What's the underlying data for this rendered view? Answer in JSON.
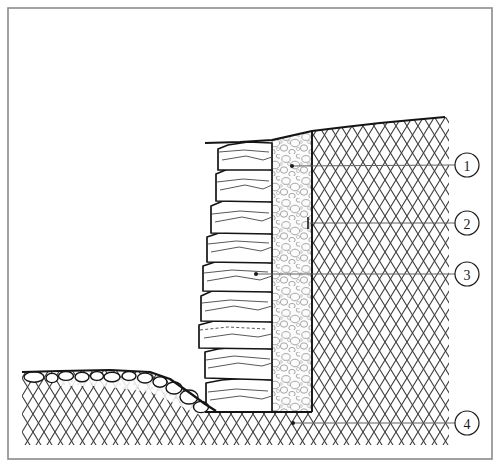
{
  "figure": {
    "border_color": "#8a8a8a",
    "background": "#ffffff",
    "line_color": "#1a1a1a",
    "hatch_color": "#3a3a3a",
    "gravel_color": "#9a9a9a",
    "leader_color": "#555555"
  },
  "callouts": [
    {
      "id": "1",
      "label": "1",
      "circle_x": 467,
      "circle_y": 165,
      "radius": 12,
      "leader_start_x": 292,
      "leader_start_y": 166,
      "leader_end_x": 455,
      "leader_end_y": 165,
      "marker": "dot",
      "target": "gravel-drainage-layer"
    },
    {
      "id": "2",
      "label": "2",
      "circle_x": 467,
      "circle_y": 223,
      "radius": 12,
      "leader_start_x": 312,
      "leader_start_y": 223,
      "leader_end_x": 455,
      "leader_end_y": 223,
      "marker": "tick",
      "target": "retained-soil-backfill"
    },
    {
      "id": "3",
      "label": "3",
      "circle_x": 467,
      "circle_y": 274,
      "radius": 12,
      "leader_start_x": 256,
      "leader_start_y": 274,
      "leader_end_x": 455,
      "leader_end_y": 274,
      "marker": "dot",
      "target": "stone-block-wall"
    },
    {
      "id": "4",
      "label": "4",
      "circle_x": 467,
      "circle_y": 423,
      "radius": 12,
      "leader_start_x": 293,
      "leader_start_y": 423,
      "leader_end_x": 455,
      "leader_end_y": 423,
      "marker": "dot",
      "target": "foundation-subsoil"
    }
  ],
  "layers": {
    "stone_wall": {
      "name": "stone-block-wall",
      "x_left": 205,
      "x_right": 272,
      "y_top": 143,
      "y_bottom": 412,
      "course_count": 8
    },
    "gravel": {
      "name": "gravel-drainage-layer",
      "x_left": 272,
      "x_right": 312,
      "y_top": 143,
      "y_bottom": 412
    },
    "soil": {
      "name": "retained-soil-hatching",
      "x_left": 312,
      "x_right": 447,
      "y_top": 117,
      "y_bottom": 440
    },
    "ground_surface": {
      "name": "ground-surface-line",
      "points": "205,143 272,140 312,131 360,125 400,121 445,117"
    },
    "foreground_ground": {
      "name": "foreground-ground-line",
      "points": "22,372 60,371 110,370 150,372 170,379 190,393 205,404 215,410"
    }
  }
}
